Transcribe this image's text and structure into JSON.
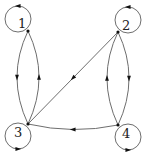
{
  "diagram": {
    "type": "directed-graph",
    "nodes": [
      {
        "id": "1",
        "label": "1"
      },
      {
        "id": "2",
        "label": "2"
      },
      {
        "id": "3",
        "label": "3"
      },
      {
        "id": "4",
        "label": "4"
      }
    ],
    "edges": [
      {
        "from": "1",
        "to": "1",
        "kind": "self-loop"
      },
      {
        "from": "2",
        "to": "2",
        "kind": "self-loop"
      },
      {
        "from": "3",
        "to": "3",
        "kind": "self-loop"
      },
      {
        "from": "4",
        "to": "4",
        "kind": "self-loop"
      },
      {
        "from": "1",
        "to": "3",
        "kind": "curved"
      },
      {
        "from": "3",
        "to": "1",
        "kind": "curved"
      },
      {
        "from": "2",
        "to": "4",
        "kind": "curved"
      },
      {
        "from": "4",
        "to": "2",
        "kind": "curved"
      },
      {
        "from": "2",
        "to": "3",
        "kind": "straight"
      },
      {
        "from": "4",
        "to": "3",
        "kind": "curved"
      }
    ],
    "colors": {
      "edge": "#6e6e6e",
      "arrow": "#111111",
      "label": "#222222"
    }
  }
}
